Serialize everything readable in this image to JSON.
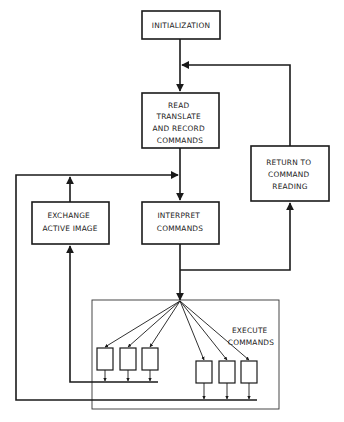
{
  "diagram": {
    "type": "flowchart",
    "nodes": {
      "initialization": {
        "lines": [
          "INITIALIZATION"
        ]
      },
      "read": {
        "lines": [
          "READ",
          "TRANSLATE",
          "AND RECORD",
          "COMMANDS"
        ]
      },
      "return": {
        "lines": [
          "RETURN TO",
          "COMMAND",
          "READING"
        ]
      },
      "exchange": {
        "lines": [
          "EXCHANGE",
          "ACTIVE IMAGE"
        ]
      },
      "interpret": {
        "lines": [
          "INTERPRET",
          "COMMANDS"
        ]
      },
      "execute": {
        "lines": [
          "EXECUTE",
          "COMMANDS"
        ]
      }
    },
    "execute_unit_groups": [
      {
        "name": "left-group",
        "units": 3
      },
      {
        "name": "right-group",
        "units": 3
      }
    ],
    "edges": [
      {
        "from": "initialization",
        "to": "read"
      },
      {
        "from": "read",
        "to": "interpret"
      },
      {
        "from": "interpret",
        "to": "execute"
      },
      {
        "from": "interpret",
        "to": "return"
      },
      {
        "from": "return",
        "to": "read"
      },
      {
        "from": "execute.left-group",
        "to": "exchange"
      },
      {
        "from": "exchange",
        "to": "interpret"
      },
      {
        "from": "execute.right-group",
        "to": "interpret"
      }
    ]
  }
}
